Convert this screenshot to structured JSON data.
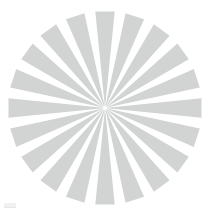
{
  "figure": {
    "kind": "radial-starburst-spinner",
    "background_color": "#ffffff",
    "canvas_width": 217,
    "canvas_height": 214
  },
  "chart_data": {
    "type": "pie",
    "subtitle": "",
    "xlabel": "",
    "ylabel": "",
    "legend_position": "none",
    "grid": false,
    "center_x": 105,
    "center_y": 108,
    "inner_radius": 2,
    "outer_radius": 97,
    "spoke_count": 20,
    "angular_pitch_deg": 18,
    "wedge_outer_width_deg": 11.5,
    "wedge_color": "#d2d4d4",
    "gap_color": "#ffffff",
    "start_angle_deg": -90,
    "categories": [
      "spoke-1",
      "spoke-2",
      "spoke-3",
      "spoke-4",
      "spoke-5",
      "spoke-6",
      "spoke-7",
      "spoke-8",
      "spoke-9",
      "spoke-10",
      "spoke-11",
      "spoke-12",
      "spoke-13",
      "spoke-14",
      "spoke-15",
      "spoke-16",
      "spoke-17",
      "spoke-18",
      "spoke-19",
      "spoke-20"
    ],
    "values": [
      97,
      97,
      97,
      97,
      97,
      97,
      97,
      97,
      97,
      97,
      97,
      97,
      97,
      97,
      97,
      97,
      97,
      97,
      97,
      97
    ],
    "angles_deg": [
      -90,
      -72,
      -54,
      -36,
      -18,
      0,
      18,
      36,
      54,
      72,
      90,
      108,
      126,
      144,
      162,
      180,
      198,
      216,
      234,
      252
    ]
  },
  "artifact": {
    "label": "faint watermark fragment",
    "color": "#efefef"
  }
}
